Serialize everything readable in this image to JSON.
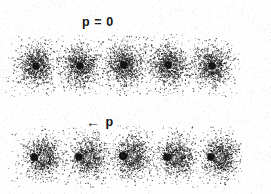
{
  "figure": {
    "name": "speckle-pattern-figure",
    "background_color": "#fefefe",
    "ink_color": "#141414",
    "width": 271,
    "height": 194
  },
  "labels": {
    "top_row": "p = 0",
    "bottom_row_arrow": "←",
    "bottom_row_symbol": "p"
  },
  "chart_data": {
    "type": "scatter",
    "title": "",
    "subtitle": "",
    "xlabel": "",
    "ylabel": "",
    "grid": false,
    "legend": null,
    "rows": [
      {
        "name": "row-top",
        "label": "p = 0",
        "label_x": 82,
        "label_y": 16,
        "dot_offset_x": 0,
        "cloud_center_y": 66,
        "panels": [
          {
            "index": 1,
            "dot_x": 36,
            "dot_y": 66,
            "dot_r": 3.8,
            "cloud_rx": 21,
            "cloud_ry": 25,
            "points": 900
          },
          {
            "index": 2,
            "dot_x": 80,
            "dot_y": 66,
            "dot_r": 3.8,
            "cloud_rx": 21,
            "cloud_ry": 25,
            "points": 900
          },
          {
            "index": 3,
            "dot_x": 124,
            "dot_y": 65,
            "dot_r": 3.9,
            "cloud_rx": 22,
            "cloud_ry": 26,
            "points": 950
          },
          {
            "index": 4,
            "dot_x": 168,
            "dot_y": 65,
            "dot_r": 3.9,
            "cloud_rx": 22,
            "cloud_ry": 26,
            "points": 950
          },
          {
            "index": 5,
            "dot_x": 212,
            "dot_y": 66,
            "dot_r": 3.8,
            "cloud_rx": 21,
            "cloud_ry": 25,
            "points": 900
          }
        ]
      },
      {
        "name": "row-bottom",
        "label": "← p",
        "label_x": 86,
        "label_y": 114,
        "dot_offset_x": -9,
        "cloud_center_y": 157,
        "panels": [
          {
            "index": 1,
            "dot_x": 34,
            "dot_y": 157,
            "dot_r": 3.8,
            "cloud_rx": 21,
            "cloud_ry": 24,
            "points": 880
          },
          {
            "index": 2,
            "dot_x": 79,
            "dot_y": 157,
            "dot_r": 3.8,
            "cloud_rx": 21,
            "cloud_ry": 24,
            "points": 880
          },
          {
            "index": 3,
            "dot_x": 123,
            "dot_y": 156,
            "dot_r": 3.9,
            "cloud_rx": 22,
            "cloud_ry": 25,
            "points": 920
          },
          {
            "index": 4,
            "dot_x": 167,
            "dot_y": 157,
            "dot_r": 3.8,
            "cloud_rx": 21,
            "cloud_ry": 24,
            "points": 880
          },
          {
            "index": 5,
            "dot_x": 211,
            "dot_y": 157,
            "dot_r": 3.8,
            "cloud_rx": 21,
            "cloud_ry": 24,
            "points": 880
          }
        ]
      }
    ]
  }
}
